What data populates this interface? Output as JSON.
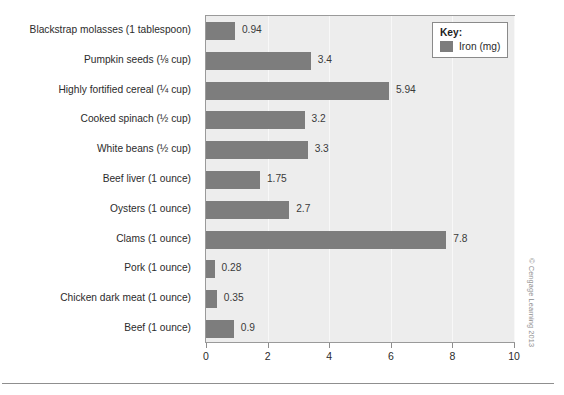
{
  "chart_data": {
    "type": "bar",
    "orientation": "horizontal",
    "title": "",
    "xlabel": "",
    "ylabel": "",
    "xlim": [
      0,
      10
    ],
    "xticks": [
      "0",
      "2",
      "4",
      "6",
      "8",
      "10"
    ],
    "grid": true,
    "legend_position": "top-right",
    "categories": [
      "Blackstrap molasses (1 tablespoon)",
      "Pumpkin seeds (⅛ cup)",
      "Highly fortified cereal (¼ cup)",
      "Cooked spinach (½ cup)",
      "White beans (½ cup)",
      "Beef liver (1 ounce)",
      "Oysters (1 ounce)",
      "Clams (1 ounce)",
      "Pork (1 ounce)",
      "Chicken dark meat (1 ounce)",
      "Beef (1 ounce)"
    ],
    "values": [
      0.94,
      3.4,
      5.94,
      3.2,
      3.3,
      1.75,
      2.7,
      7.8,
      0.28,
      0.35,
      0.9
    ],
    "value_labels": [
      "0.94",
      "3.4",
      "5.94",
      "3.2",
      "3.3",
      "1.75",
      "2.7",
      "7.8",
      "0.28",
      "0.35",
      "0.9"
    ],
    "series": [
      {
        "name": "Iron (mg)",
        "color": "#7d7d7d",
        "values": [
          0.94,
          3.4,
          5.94,
          3.2,
          3.3,
          1.75,
          2.7,
          7.8,
          0.28,
          0.35,
          0.9
        ]
      }
    ]
  },
  "legend": {
    "title": "Key:",
    "entry_label": "Iron (mg)",
    "swatch_color": "#7d7d7d"
  },
  "credit": {
    "text": "© Cengage Learning 2013"
  },
  "colors": {
    "bar": "#7d7d7d",
    "plot_background": "#ededed",
    "plot_border": "#9a9a9a",
    "gridline": "#f8f8f8",
    "text": "#2b2b2b"
  }
}
